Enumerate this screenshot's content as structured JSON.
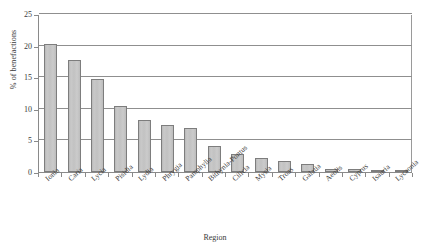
{
  "chart_data": {
    "type": "bar",
    "title": "",
    "xlabel": "Region",
    "ylabel": "% of benefactions",
    "ylim": [
      0,
      25
    ],
    "yticks": [
      0,
      5,
      10,
      15,
      20,
      25
    ],
    "grid": true,
    "legend": "none",
    "categories": [
      "Ionia",
      "Caria",
      "Lycia",
      "Pisidia",
      "Lydia",
      "Phrygia",
      "Pamphylia",
      "Bithynia-Pontus",
      "Cilicia",
      "Mysia",
      "Troas",
      "Galatia",
      "Aeolis",
      "Cyprus",
      "Isauria",
      "Lycaonia"
    ],
    "values": [
      20.3,
      17.7,
      14.7,
      10.4,
      8.3,
      7.4,
      6.9,
      4.1,
      2.8,
      2.2,
      1.8,
      1.2,
      0.5,
      0.5,
      0.3,
      0.3
    ],
    "series_name": "% of benefactions",
    "bar_fill_color": "#c3c3c3",
    "bar_border_color": "#7d7d7d",
    "axis_color": "#8a8a8a",
    "grid_color": "#8f8f8f",
    "text_color": "#3a3a3a"
  }
}
